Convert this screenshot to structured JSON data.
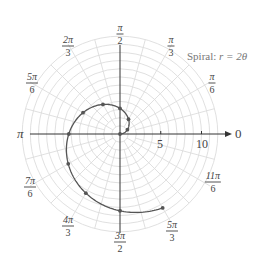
{
  "chart_data": {
    "type": "line",
    "coordinate_system": "polar",
    "title": "Spiral: r = 2θ",
    "title_prefix": "Spiral:",
    "title_equation": "r = 2θ",
    "equation": "r = 2*theta",
    "theta_range": [
      0,
      5.235987756
    ],
    "theta_range_label": [
      "0",
      "5π/3"
    ],
    "points": [
      {
        "theta_label": "0",
        "theta": 0.0,
        "r": 0.0
      },
      {
        "theta_label": "π/6",
        "theta": 0.5236,
        "r": 1.05
      },
      {
        "theta_label": "π/3",
        "theta": 1.0472,
        "r": 2.09
      },
      {
        "theta_label": "π/2",
        "theta": 1.5708,
        "r": 3.14
      },
      {
        "theta_label": "2π/3",
        "theta": 2.0944,
        "r": 4.19
      },
      {
        "theta_label": "5π/6",
        "theta": 2.618,
        "r": 5.24
      },
      {
        "theta_label": "π",
        "theta": 3.1416,
        "r": 6.28
      },
      {
        "theta_label": "7π/6",
        "theta": 3.6652,
        "r": 7.33
      },
      {
        "theta_label": "4π/3",
        "theta": 4.1888,
        "r": 8.38
      },
      {
        "theta_label": "3π/2",
        "theta": 4.7124,
        "r": 9.42
      },
      {
        "theta_label": "5π/3",
        "theta": 5.236,
        "r": 10.47
      }
    ],
    "angle_labels": [
      {
        "label_num": "π",
        "label_den": "2",
        "deg": 90
      },
      {
        "label_num": "π",
        "label_den": "3",
        "deg": 60
      },
      {
        "label_num": "π",
        "label_den": "6",
        "deg": 30
      },
      {
        "label": "0",
        "deg": 0
      },
      {
        "label_num": "11π",
        "label_den": "6",
        "deg": 330
      },
      {
        "label_num": "5π",
        "label_den": "3",
        "deg": 300
      },
      {
        "label_num": "3π",
        "label_den": "2",
        "deg": 270
      },
      {
        "label_num": "4π",
        "label_den": "3",
        "deg": 240
      },
      {
        "label_num": "7π",
        "label_den": "6",
        "deg": 210
      },
      {
        "label": "π",
        "deg": 180
      },
      {
        "label_num": "5π",
        "label_den": "6",
        "deg": 150
      },
      {
        "label_num": "2π",
        "label_den": "3",
        "deg": 120
      }
    ],
    "radial_ticks": [
      "5",
      "10"
    ],
    "radial_range": [
      0,
      12
    ],
    "grid": {
      "circles_every": 1,
      "radial_lines_every_deg": 15,
      "on": true
    },
    "legend": "none",
    "colors": {
      "curve": "#555555",
      "points": "#555555",
      "grid": "#dddddd",
      "axes": "#333333"
    }
  }
}
